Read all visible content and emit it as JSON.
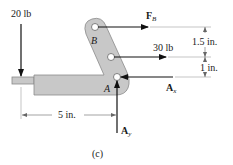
{
  "figure": {
    "caption": "(c)",
    "colors": {
      "member_fill": "#c8c8c8",
      "member_stroke": "#8a8a8a",
      "force": "#111111",
      "dimension": "#666666"
    },
    "points": {
      "B": "B",
      "A": "A"
    },
    "forces": {
      "load_left": {
        "label": "20 lb",
        "direction": "down"
      },
      "FB": {
        "label": "F",
        "subscript": "B",
        "direction": "right"
      },
      "load_mid": {
        "label": "30 lb",
        "direction": "right"
      },
      "Ax": {
        "label": "A",
        "subscript": "x",
        "direction": "left"
      },
      "Ay": {
        "label": "A",
        "subscript": "y",
        "direction": "up"
      }
    },
    "dimensions": {
      "upper_vertical": "1.5 in.",
      "lower_vertical": "1 in.",
      "horizontal": "5 in."
    }
  }
}
